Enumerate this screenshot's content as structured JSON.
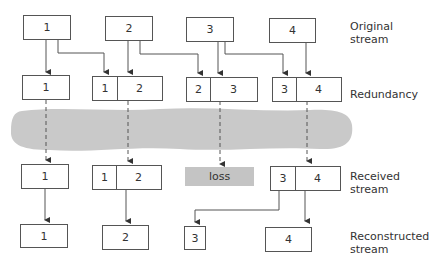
{
  "diagram": {
    "rows": {
      "original": {
        "label": "Original stream",
        "label_line1": "Original",
        "label_line2": "stream",
        "packets": [
          "1",
          "2",
          "3",
          "4"
        ]
      },
      "redundancy": {
        "label": "Redundancy",
        "packets": [
          {
            "parts": [
              "1"
            ]
          },
          {
            "parts": [
              "1",
              "2"
            ]
          },
          {
            "parts": [
              "2",
              "3"
            ]
          },
          {
            "parts": [
              "3",
              "4"
            ]
          }
        ]
      },
      "received": {
        "label": "Received stream",
        "label_line1": "Received",
        "label_line2": "stream",
        "packets": [
          {
            "parts": [
              "1"
            ]
          },
          {
            "parts": [
              "1",
              "2"
            ]
          },
          {
            "lost": true,
            "text": "loss"
          },
          {
            "parts": [
              "3",
              "4"
            ]
          }
        ]
      },
      "reconstructed": {
        "label": "Reconstructed stream",
        "label_line1": "Reconstructed",
        "label_line2": "stream",
        "packets": [
          "1",
          "2",
          "3",
          "4"
        ]
      }
    },
    "network_band": {
      "label": "network",
      "color": "#c4c4c4"
    },
    "colors": {
      "line": "#555555",
      "loss_fill": "#c4c4c4",
      "band": "#c9c9c9"
    }
  }
}
